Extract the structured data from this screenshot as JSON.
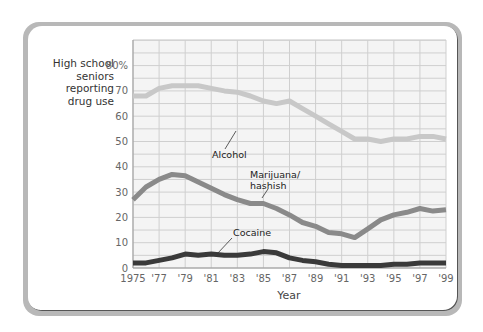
{
  "chart_data": {
    "type": "line",
    "title": "",
    "ylabel": "High school seniors reporting drug use",
    "xlabel": "Year",
    "ylim": [
      0,
      80
    ],
    "xlim": [
      1975,
      1999
    ],
    "grid": true,
    "legend": "inline annotations",
    "x": [
      1975,
      1976,
      1977,
      1978,
      1979,
      1980,
      1981,
      1982,
      1983,
      1984,
      1985,
      1986,
      1987,
      1988,
      1989,
      1990,
      1991,
      1992,
      1993,
      1994,
      1995,
      1996,
      1997,
      1998,
      1999
    ],
    "x_tick_labels": [
      "1975",
      "'77",
      "'79",
      "'81",
      "'83",
      "'85",
      "'87",
      "'89",
      "'91",
      "'93",
      "'95",
      "'97",
      "'99"
    ],
    "y_tick_labels": [
      "0",
      "10",
      "20",
      "30",
      "40",
      "50",
      "60",
      "70",
      "80%"
    ],
    "series": [
      {
        "name": "Alcohol",
        "color": "#c8c8c8",
        "values": [
          68,
          68,
          71,
          72,
          72,
          72,
          71,
          70,
          69.5,
          68,
          66,
          65,
          66,
          63,
          60,
          57,
          54,
          51,
          51,
          50,
          51,
          51,
          52,
          52,
          51
        ]
      },
      {
        "name": "Marijuana/ hashish",
        "color": "#8a8a8a",
        "values": [
          27,
          32,
          35,
          37,
          36.5,
          34,
          31.5,
          29,
          27,
          25.5,
          25.5,
          23.5,
          21,
          18,
          16.5,
          14,
          13.5,
          12,
          15.5,
          19,
          21,
          22,
          23.5,
          22.5,
          23
        ]
      },
      {
        "name": "Cocaine",
        "color": "#3a3a3a",
        "values": [
          2,
          2,
          3,
          4,
          5.5,
          5,
          5.5,
          5,
          5,
          5.5,
          6.5,
          6,
          4,
          3,
          2.5,
          1.5,
          1,
          1,
          1,
          1,
          1.5,
          1.5,
          2,
          2,
          2
        ]
      }
    ]
  },
  "labels": {
    "ylabel_lines": [
      "High school",
      "seniors",
      "reporting",
      "drug use"
    ],
    "xlabel": "Year",
    "alcohol": "Alcohol",
    "marijuana_1": "Marijuana/",
    "marijuana_2": "hashish",
    "cocaine": "Cocaine"
  }
}
